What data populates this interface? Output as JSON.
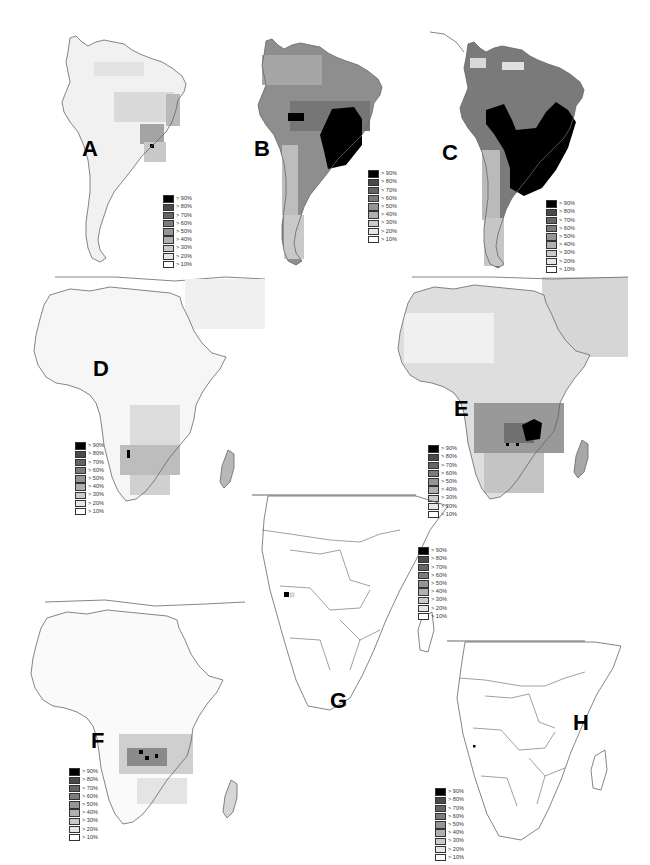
{
  "figure": {
    "panel_count": 8,
    "panels": [
      {
        "id": "A",
        "label": "A",
        "region": "South America",
        "pattern": "mostly light (<20%), moderate patch in south-central Brazil and eastern coast, single >90% cell near Paraguay"
      },
      {
        "id": "B",
        "label": "B",
        "region": "South America",
        "pattern": "medium gray across continent, large >90% black block over central/southeastern Brazil, light Andes and Patagonia"
      },
      {
        "id": "C",
        "label": "C",
        "region": "South America",
        "pattern": "darker overall, very large >90% black area over central/eastern Brazil and south Bolivia, light Andes/Patagonia"
      },
      {
        "id": "D",
        "label": "D",
        "region": "Africa",
        "pattern": "mostly white in north, moderate gray in southern Africa, single >90% cell on Angolan coast"
      },
      {
        "id": "E",
        "label": "E",
        "region": "Africa",
        "pattern": "light gray north, darker southern-central band, >90% black cluster in Zambia/Malawi region"
      },
      {
        "id": "F",
        "label": "F",
        "region": "Africa",
        "pattern": "mostly white, dark band across Angola/Zambia with a few >90% cells"
      },
      {
        "id": "G",
        "label": "G",
        "region": "Southern Africa (political borders)",
        "pattern": "single >90% cell in western Angola"
      },
      {
        "id": "H",
        "label": "H",
        "region": "Southern Africa (political borders)",
        "pattern": "single small >90% dot in western Angola"
      }
    ]
  },
  "legend": {
    "items": [
      {
        "label": "> 90%",
        "color": "#000000"
      },
      {
        "label": "> 80%",
        "color": "#4a4a4a"
      },
      {
        "label": "> 70%",
        "color": "#646464"
      },
      {
        "label": "> 60%",
        "color": "#7c7c7c"
      },
      {
        "label": "> 50%",
        "color": "#959595"
      },
      {
        "label": "> 40%",
        "color": "#b0b0b0"
      },
      {
        "label": "> 30%",
        "color": "#cacaca"
      },
      {
        "label": "> 20%",
        "color": "#e6e6e6"
      },
      {
        "label": "> 10%",
        "color": "#ffffff"
      }
    ]
  },
  "labels": {
    "A": "A",
    "B": "B",
    "C": "C",
    "D": "D",
    "E": "E",
    "F": "F",
    "G": "G",
    "H": "H"
  }
}
